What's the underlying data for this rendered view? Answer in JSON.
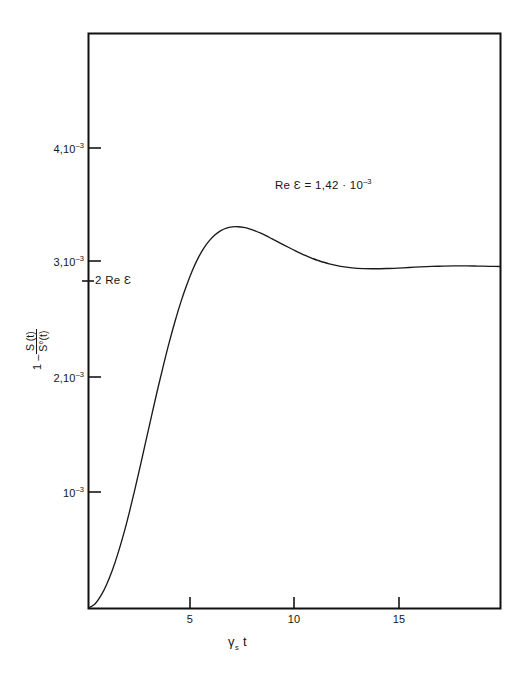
{
  "chart_data": {
    "type": "line",
    "title": "",
    "xlabel": "γₛ t",
    "ylabel": "1 - S(t)/S°(t)",
    "xlim": [
      0,
      18
    ],
    "ylim": [
      0,
      0.00485
    ],
    "grid": false,
    "legend": null,
    "annotations": [
      {
        "name": "re-epsilon-value",
        "text": "Re Ɛ = 1,42 · 10⁻³",
        "x": 9.2,
        "y": 0.00418
      },
      {
        "name": "two-re-epsilon-marker",
        "text": "2 Re Ɛ",
        "x": 0,
        "y": 0.00284
      }
    ],
    "x_ticks": [
      5,
      10,
      15
    ],
    "x_tick_labels": [
      "5",
      "10",
      "15"
    ],
    "y_ticks": [
      0.001,
      0.002,
      0.003,
      0.004
    ],
    "y_tick_labels": [
      "10⁻³",
      "2,10⁻³",
      "3,10⁻³",
      "4,10⁻³"
    ],
    "series": [
      {
        "name": "1 - S(t)/S0(t)",
        "color": "#1a1a1a",
        "x": [
          0.0,
          0.25,
          0.5,
          0.75,
          1.0,
          1.25,
          1.5,
          1.75,
          2.0,
          2.25,
          2.5,
          2.75,
          3.0,
          3.25,
          3.5,
          3.75,
          4.0,
          4.25,
          4.5,
          4.75,
          5.0,
          5.25,
          5.5,
          5.75,
          6.0,
          6.25,
          6.5,
          6.75,
          7.0,
          7.25,
          7.5,
          7.75,
          8.0,
          8.25,
          8.5,
          8.75,
          9.0,
          9.25,
          9.5,
          9.75,
          10.0,
          10.5,
          11.0,
          11.5,
          12.0,
          12.5,
          13.0,
          13.5,
          14.0,
          14.5,
          15.0,
          15.5,
          16.0,
          16.5,
          17.0,
          17.5,
          18.0
        ],
        "y": [
          0.0,
          3.2e-05,
          0.0001,
          0.000195,
          0.000315,
          0.00046,
          0.000625,
          0.00081,
          0.00101,
          0.00122,
          0.001435,
          0.00165,
          0.00186,
          0.00206,
          0.00225,
          0.002425,
          0.002585,
          0.002725,
          0.00285,
          0.002955,
          0.00304,
          0.003105,
          0.003155,
          0.00319,
          0.003212,
          0.003222,
          0.003223,
          0.003217,
          0.003205,
          0.003188,
          0.003168,
          0.003145,
          0.00312,
          0.003095,
          0.00307,
          0.003045,
          0.00302,
          0.002997,
          0.002976,
          0.002956,
          0.002938,
          0.002908,
          0.002887,
          0.002874,
          0.002868,
          0.002867,
          0.002869,
          0.002873,
          0.002878,
          0.002883,
          0.002887,
          0.00289,
          0.002892,
          0.002892,
          0.00289,
          0.002888,
          0.002886
        ]
      }
    ]
  },
  "axes": {
    "frame_color": "#111111",
    "line_color": "#1a1a1a",
    "y_title_parts": {
      "lead": "1 –",
      "numerator": "S (t)",
      "denominator": "S°(t)"
    },
    "x_title_parts": {
      "gamma": "γ",
      "sub": "s",
      "t": "t"
    }
  },
  "labels": {
    "y4": {
      "mantissa": "4,10",
      "exponent": "–3"
    },
    "y3": {
      "mantissa": "3,10",
      "exponent": "–3"
    },
    "y2": {
      "mantissa": "2,10",
      "exponent": "–3"
    },
    "y1": {
      "mantissa": "10",
      "exponent": "–3"
    },
    "two_re_eps": "2 Re Ɛ",
    "x5": "5",
    "x10": "10",
    "x15": "15"
  },
  "annotation": {
    "lead": "Re Ɛ =",
    "mantissa": "1,42 · 10",
    "exponent": "–3"
  }
}
